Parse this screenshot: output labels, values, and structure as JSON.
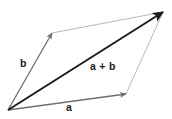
{
  "figure": {
    "background_color": "#ffffff",
    "width": 172,
    "height": 119
  },
  "labels": {
    "vector_b": "b",
    "vector_a": "a",
    "vector_sum": "a + b"
  },
  "colors": {
    "vector_a_stroke": "#6f6f6f",
    "vector_b_stroke": "#6f6f6f",
    "vector_sum_stroke": "#1c1c1c",
    "parallelogram_edge_stroke": "#b9b9b9",
    "label_text": "#1a1a1a"
  },
  "geometry": {
    "origin": {
      "x": 8,
      "y": 110
    },
    "tip_b": {
      "x": 52,
      "y": 33
    },
    "tip_a": {
      "x": 126,
      "y": 94
    },
    "tip_sum": {
      "x": 163,
      "y": 12
    },
    "vectors": [
      {
        "name": "b",
        "from": [
          8,
          110
        ],
        "to": [
          52,
          33
        ],
        "arrowhead": true,
        "weight": 1.3
      },
      {
        "name": "a",
        "from": [
          8,
          110
        ],
        "to": [
          126,
          94
        ],
        "arrowhead": true,
        "weight": 1.3
      },
      {
        "name": "a + b",
        "from": [
          8,
          110
        ],
        "to": [
          163,
          12
        ],
        "arrowhead": true,
        "weight": 2.0
      }
    ],
    "construction_edges": [
      {
        "name": "b-to-sum",
        "from": [
          52,
          33
        ],
        "to": [
          163,
          12
        ]
      },
      {
        "name": "a-to-sum",
        "from": [
          126,
          94
        ],
        "to": [
          163,
          12
        ]
      }
    ]
  }
}
